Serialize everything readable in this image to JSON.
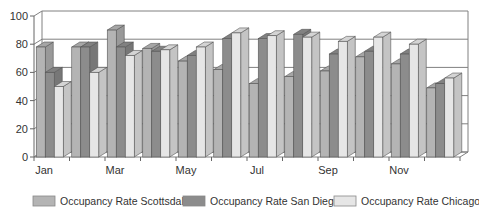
{
  "chart_data": {
    "type": "bar",
    "style": "3d-clustered-column",
    "title": "",
    "xlabel": "",
    "ylabel": "",
    "ylim": [
      0,
      100
    ],
    "yticks": [
      0,
      20,
      40,
      60,
      80,
      100
    ],
    "grid": true,
    "legend_position": "bottom",
    "categories": [
      "Jan",
      "Feb",
      "Mar",
      "Apr",
      "May",
      "Jun",
      "Jul",
      "Aug",
      "Sep",
      "Oct",
      "Nov",
      "Dec"
    ],
    "visible_xtick_labels": [
      "Jan",
      "",
      "Mar",
      "",
      "May",
      "",
      "Jul",
      "",
      "Sep",
      "",
      "Nov",
      ""
    ],
    "series": [
      {
        "name": "Occupancy Rate Scottsdale",
        "color": "#b4b4b4",
        "values": [
          78,
          78,
          90,
          77,
          68,
          62,
          52,
          57,
          61,
          71,
          66,
          49
        ]
      },
      {
        "name": "Occupancy Rate San Diego",
        "color": "#8c8c8c",
        "values": [
          60,
          78,
          78,
          75,
          72,
          84,
          84,
          87,
          73,
          75,
          73,
          52
        ]
      },
      {
        "name": "Occupancy Rate Chicago",
        "color": "#e6e6e6",
        "values": [
          50,
          60,
          72,
          76,
          78,
          88,
          86,
          85,
          82,
          85,
          80,
          56
        ]
      }
    ]
  },
  "legend": {
    "items": [
      {
        "label": "Occupancy Rate Scottsdale",
        "color": "#b4b4b4"
      },
      {
        "label": "Occupancy Rate San Diego",
        "color": "#8c8c8c"
      },
      {
        "label": "Occupancy Rate Chicago",
        "color": "#e6e6e6"
      }
    ]
  }
}
